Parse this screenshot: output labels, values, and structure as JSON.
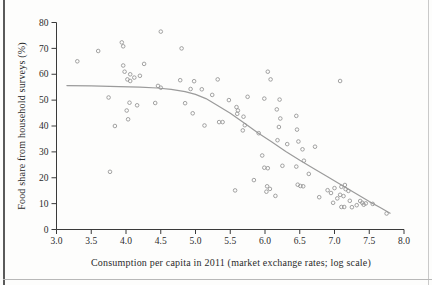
{
  "figure": {
    "kind": "book-page scatter figure",
    "background_color": "#fdfdfc",
    "border_left_color": "#5a5a5a",
    "border_bottom_color": "#b8b8b8",
    "border_right_color": "#c9c9c9"
  },
  "chart_data": {
    "type": "scatter",
    "title": "",
    "xlabel": "Consumption per capita in 2011 (market exchange rates; log scale)",
    "ylabel": "Food share from household surveys (%)",
    "xlim": [
      3.0,
      8.0
    ],
    "ylim": [
      0,
      80
    ],
    "xticks": [
      "3.0",
      "3.5",
      "4.0",
      "4.5",
      "5.0",
      "5.5",
      "6.0",
      "6.5",
      "7.0",
      "7.5",
      "8.0"
    ],
    "yticks": [
      "0",
      "10",
      "20",
      "30",
      "40",
      "50",
      "60",
      "70",
      "80"
    ],
    "grid": false,
    "legend": null,
    "marker": "open-circle",
    "colors": {
      "points": "#979797",
      "trend_line": "#9b9b9b",
      "axis": "#3a3a3a",
      "text": "#2b2b2b"
    },
    "series": [
      {
        "name": "household-survey-observations",
        "points": [
          [
            3.3,
            65
          ],
          [
            3.6,
            69
          ],
          [
            3.75,
            51
          ],
          [
            3.77,
            22.3
          ],
          [
            3.84,
            40
          ],
          [
            3.94,
            72.3
          ],
          [
            3.96,
            70.8
          ],
          [
            3.96,
            63.4
          ],
          [
            4.26,
            64
          ],
          [
            3.98,
            61
          ],
          [
            4.06,
            60
          ],
          [
            4.2,
            59.4
          ],
          [
            4.12,
            58.7
          ],
          [
            4.02,
            58
          ],
          [
            4.06,
            57.4
          ],
          [
            4.5,
            76.5
          ],
          [
            4.46,
            55.5
          ],
          [
            4.5,
            54.8
          ],
          [
            4.05,
            49
          ],
          [
            4.16,
            48
          ],
          [
            4.42,
            48.9
          ],
          [
            4.01,
            46
          ],
          [
            4.03,
            42.6
          ],
          [
            4.8,
            70
          ],
          [
            4.78,
            57.7
          ],
          [
            4.98,
            57.3
          ],
          [
            4.93,
            54.3
          ],
          [
            5.09,
            54.2
          ],
          [
            4.85,
            48.8
          ],
          [
            4.96,
            44.9
          ],
          [
            5.32,
            58
          ],
          [
            6.04,
            61
          ],
          [
            6.08,
            58
          ],
          [
            7.08,
            57.4
          ],
          [
            5.24,
            52
          ],
          [
            5.48,
            50
          ],
          [
            5.75,
            51.3
          ],
          [
            5.99,
            50.6
          ],
          [
            6.21,
            50.2
          ],
          [
            5.59,
            47.3
          ],
          [
            5.61,
            46
          ],
          [
            5.6,
            44.7
          ],
          [
            5.69,
            43.6
          ],
          [
            6.17,
            46.4
          ],
          [
            6.45,
            43.9
          ],
          [
            6.22,
            42.9
          ],
          [
            5.34,
            41.5
          ],
          [
            5.39,
            41.5
          ],
          [
            5.13,
            40.2
          ],
          [
            5.71,
            40.3
          ],
          [
            5.68,
            38.3
          ],
          [
            5.91,
            37.2
          ],
          [
            6.2,
            39.6
          ],
          [
            6.18,
            34.5
          ],
          [
            6.32,
            33
          ],
          [
            6.46,
            38.6
          ],
          [
            6.48,
            34
          ],
          [
            6.72,
            32
          ],
          [
            6.54,
            31
          ],
          [
            6.56,
            26.6
          ],
          [
            6.45,
            24.3
          ],
          [
            6.63,
            21.5
          ],
          [
            5.96,
            28.6
          ],
          [
            5.99,
            23.9
          ],
          [
            6.04,
            23.7
          ],
          [
            6.25,
            24.6
          ],
          [
            5.84,
            19.1
          ],
          [
            5.57,
            15.1
          ],
          [
            6.03,
            16.7
          ],
          [
            6.07,
            15.7
          ],
          [
            6.02,
            14.6
          ],
          [
            6.15,
            13
          ],
          [
            6.47,
            17.3
          ],
          [
            6.51,
            16.8
          ],
          [
            6.55,
            16.7
          ],
          [
            6.78,
            12.5
          ],
          [
            6.9,
            15.2
          ],
          [
            6.95,
            14.1
          ],
          [
            7.0,
            16
          ],
          [
            6.98,
            10.3
          ],
          [
            7.04,
            12
          ],
          [
            7.1,
            16.5
          ],
          [
            7.15,
            17.2
          ],
          [
            7.16,
            15.6
          ],
          [
            7.2,
            14.9
          ],
          [
            7.08,
            13.4
          ],
          [
            7.13,
            12.9
          ],
          [
            7.22,
            11.1
          ],
          [
            7.1,
            8.7
          ],
          [
            7.14,
            8.7
          ],
          [
            7.25,
            8.6
          ],
          [
            7.32,
            9.4
          ],
          [
            7.37,
            11
          ],
          [
            7.4,
            10.3
          ],
          [
            7.42,
            9.6
          ],
          [
            7.45,
            10.1
          ],
          [
            7.55,
            9.9
          ],
          [
            7.75,
            6.2
          ]
        ]
      }
    ],
    "trend_line": [
      [
        3.15,
        55.6
      ],
      [
        3.5,
        55.5
      ],
      [
        3.9,
        55.2
      ],
      [
        4.2,
        55.0
      ],
      [
        4.45,
        54.7
      ],
      [
        4.65,
        54.2
      ],
      [
        4.85,
        53.3
      ],
      [
        5.0,
        52.2
      ],
      [
        5.15,
        50.6
      ],
      [
        5.3,
        48.2
      ],
      [
        5.5,
        44.9
      ],
      [
        5.7,
        41.2
      ],
      [
        5.9,
        37.3
      ],
      [
        6.1,
        33.8
      ],
      [
        6.3,
        30.2
      ],
      [
        6.5,
        26.8
      ],
      [
        6.7,
        23.6
      ],
      [
        6.9,
        20.4
      ],
      [
        7.1,
        17.2
      ],
      [
        7.3,
        14.0
      ],
      [
        7.5,
        10.8
      ],
      [
        7.65,
        8.6
      ],
      [
        7.8,
        6.3
      ]
    ]
  }
}
